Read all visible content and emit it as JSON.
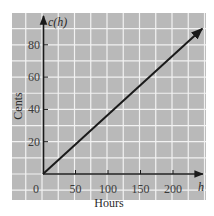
{
  "chart_data": {
    "type": "line",
    "title": "",
    "xlabel": "Hours",
    "ylabel": "Cents",
    "x_axis_var": "h",
    "y_axis_var": "c(h)",
    "xlim": [
      -45,
      250
    ],
    "ylim": [
      -16,
      100
    ],
    "x_ticks": [
      50,
      100,
      150,
      200
    ],
    "x_tick_labels": [
      "50",
      "100",
      "150",
      "200"
    ],
    "y_ticks": [
      20,
      40,
      60,
      80
    ],
    "y_tick_labels": [
      "20",
      "40",
      "60",
      "80"
    ],
    "origin_label": "0",
    "grid": true,
    "grid_step_x": 25,
    "grid_step_y": 10,
    "series": [
      {
        "name": "c(h)",
        "x": [
          0,
          245
        ],
        "y": [
          0,
          90
        ],
        "slope": 0.367,
        "arrow_end": true
      }
    ],
    "colors": {
      "panel_background": "#b9b9b9",
      "grid_lines": "#f2f2f2",
      "axes": "#1a1a1a",
      "line": "#1a1a1a"
    }
  }
}
